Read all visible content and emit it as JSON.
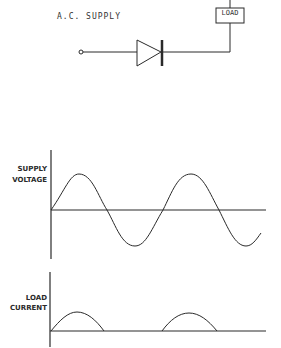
{
  "circuit": {
    "supply_label": "A.C. SUPPLY",
    "load_label": "LOAD",
    "components": [
      "input-terminal",
      "diode",
      "load"
    ]
  },
  "graphs": {
    "voltage": {
      "label_line1": "SUPPLY",
      "label_line2": "VOLTAGE",
      "waveform": "full sine wave (approx. 2 cycles)"
    },
    "current": {
      "label_line1": "LOAD",
      "label_line2": "CURRENT",
      "waveform": "half-wave rectified (positive half-cycles only)"
    }
  },
  "colors": {
    "line": "#2a2a2a",
    "background": "#ffffff"
  }
}
